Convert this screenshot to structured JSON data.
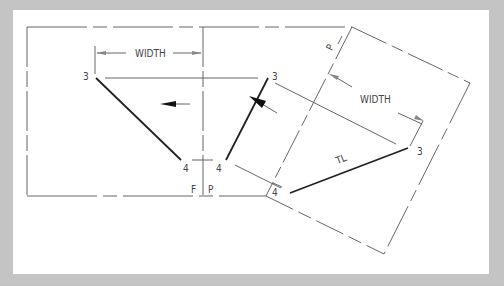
{
  "diagram": {
    "labels": {
      "width_left": "WIDTH",
      "width_right": "WIDTH",
      "point3_front": "3",
      "point4_front": "4",
      "point3_profile": "3",
      "point4_profile": "4",
      "point3_aux": "3",
      "point4_aux": "4",
      "true_length": "TL",
      "fold_front": "F",
      "fold_profile": "P",
      "fold_aux_p": "P",
      "fold_aux_1": "1"
    },
    "colors": {
      "background": "#c4c4c4",
      "paper": "#ffffff",
      "line": "#555555",
      "object_line": "#222222"
    }
  }
}
